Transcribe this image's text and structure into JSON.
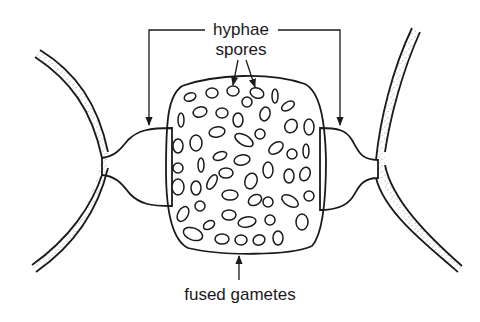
{
  "diagram": {
    "type": "labelled-biology-diagram",
    "labels": {
      "hyphae": "hyphae",
      "spores": "spores",
      "fused_gametes": "fused gametes"
    },
    "colors": {
      "ink": "#1a1a1a",
      "background": "#ffffff",
      "stipple": "#8a8a8a"
    }
  }
}
